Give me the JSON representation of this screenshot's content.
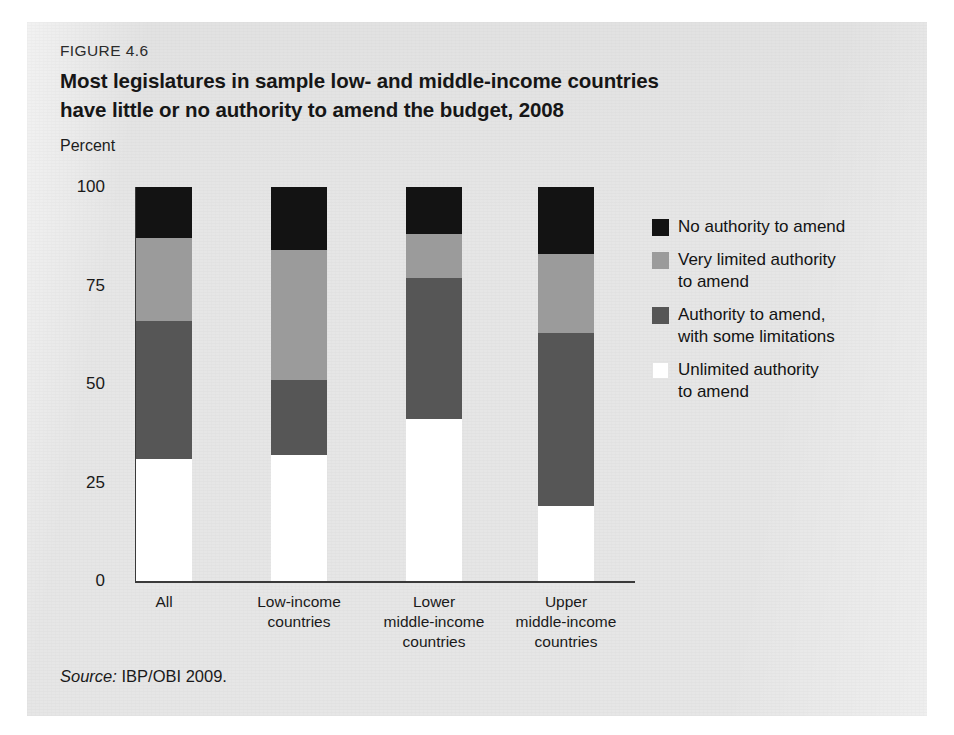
{
  "figure": {
    "number": "FIGURE 4.6",
    "title": "Most legislatures in sample low- and middle-income countries have little or no authority to amend the budget, 2008",
    "source_label": "Source:",
    "source_text": " IBP/OBI 2009."
  },
  "colors": {
    "panel_background": "#e6e6e6",
    "no_authority": "#131313",
    "very_limited": "#9b9b9b",
    "some_limitations": "#565656",
    "unlimited": "#ffffff",
    "axis": "#3a3a3a"
  },
  "chart_data": {
    "type": "bar",
    "subtype": "stacked-vertical-100",
    "title": "Most legislatures in sample low- and middle-income countries have little or no authority to amend the budget, 2008",
    "xlabel": "",
    "ylabel": "Percent",
    "ylim": [
      0,
      100
    ],
    "yticks": [
      0,
      25,
      50,
      75,
      100
    ],
    "ytick_labels": [
      "0",
      "25",
      "50",
      "75",
      "100"
    ],
    "grid": false,
    "legend_position": "right",
    "categories": [
      "All",
      "Low-income countries",
      "Lower middle-income countries",
      "Upper middle-income countries"
    ],
    "category_lines": [
      [
        "All"
      ],
      [
        "Low-income",
        "countries"
      ],
      [
        "Lower",
        "middle-income",
        "countries"
      ],
      [
        "Upper",
        "middle-income",
        "countries"
      ]
    ],
    "series": [
      {
        "name": "Unlimited authority to amend",
        "color": "#ffffff",
        "values": [
          31,
          32,
          41,
          19
        ]
      },
      {
        "name": "Authority to amend, with some limitations",
        "color": "#565656",
        "values": [
          35,
          19,
          36,
          44
        ]
      },
      {
        "name": "Very limited authority to amend",
        "color": "#9b9b9b",
        "values": [
          21,
          33,
          11,
          20
        ]
      },
      {
        "name": "No authority to amend",
        "color": "#131313",
        "values": [
          13,
          16,
          12,
          17
        ]
      }
    ],
    "legend": [
      {
        "label_lines": [
          "No authority to amend"
        ],
        "color": "#131313"
      },
      {
        "label_lines": [
          "Very limited authority",
          "to amend"
        ],
        "color": "#9b9b9b"
      },
      {
        "label_lines": [
          "Authority to amend,",
          "with some limitations"
        ],
        "color": "#565656"
      },
      {
        "label_lines": [
          "Unlimited authority",
          "to amend"
        ],
        "color": "#ffffff"
      }
    ]
  }
}
